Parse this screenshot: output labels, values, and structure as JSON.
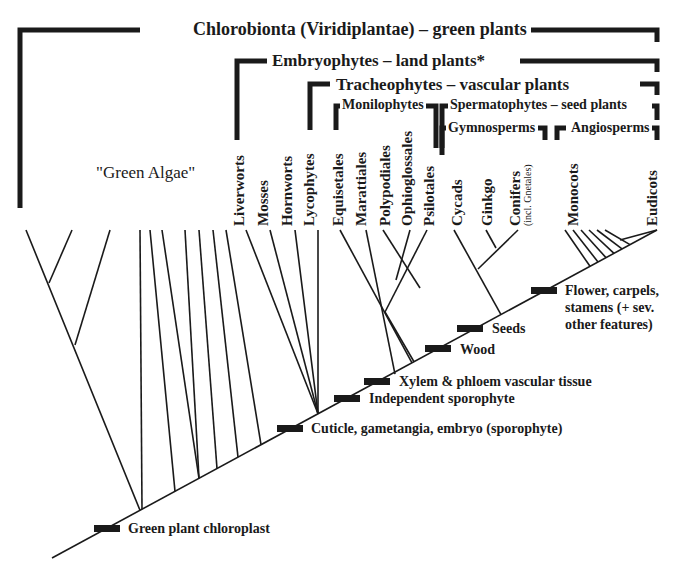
{
  "clades": {
    "chlorobionta": "Chlorobionta (Viridiplantae) – green plants",
    "embryophytes": "Embryophytes – land plants*",
    "tracheophytes": "Tracheophytes – vascular plants",
    "monilophytes": "Monilophytes",
    "spermatophytes": "Spermatophytes – seed plants",
    "gymnosperms": "Gymnosperms",
    "angiosperms": "Angiosperms"
  },
  "green_algae_label": "\"Green Algae\"",
  "taxa": [
    {
      "name": "Liverworts"
    },
    {
      "name": "Mosses"
    },
    {
      "name": "Hornworts"
    },
    {
      "name": "Lycophytes"
    },
    {
      "name": "Equisetales"
    },
    {
      "name": "Marattiales"
    },
    {
      "name": "Polypodiales"
    },
    {
      "name": "Ophioglossales"
    },
    {
      "name": "Psilotales"
    },
    {
      "name": "Cycads"
    },
    {
      "name": "Ginkgo"
    },
    {
      "name": "Conifers",
      "sub": "(incl. Gnetales)"
    },
    {
      "name": "Monocots"
    },
    {
      "name": "Eudicots"
    }
  ],
  "synapomorphies": [
    {
      "label": "Green plant chloroplast"
    },
    {
      "label": "Cuticle, gametangia, embryo (sporophyte)"
    },
    {
      "label": "Independent sporophyte"
    },
    {
      "label": "Xylem & phloem vascular tissue"
    },
    {
      "label": "Wood"
    },
    {
      "label": "Seeds"
    },
    {
      "label": "Flower, carpels, stamens (+ sev. other features)",
      "lines": [
        "Flower, carpels,",
        "stamens (+ sev.",
        "other features)"
      ]
    }
  ],
  "colors": {
    "line": "#1a1a1a",
    "marker": "#1a1a1a",
    "background": "#ffffff"
  }
}
